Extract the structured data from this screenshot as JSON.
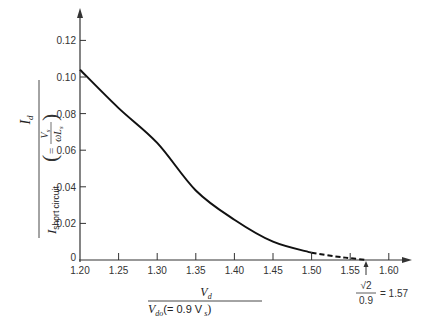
{
  "chart_data": {
    "type": "line",
    "title": "",
    "xlabel": "V_d / V_do (= 0.9 V_s)",
    "ylabel": "I_d / I_short circuit (= V_s / (ωL_s))",
    "xlim": [
      1.2,
      1.62
    ],
    "ylim": [
      0,
      0.13
    ],
    "grid": false,
    "x_ticks": [
      "1.20",
      "1.25",
      "1.30",
      "1.35",
      "1.40",
      "1.45",
      "1.50",
      "1.55",
      "1.60"
    ],
    "y_ticks": [
      "0",
      "0.02",
      "0.04",
      "0.06",
      "0.08",
      "0.10",
      "0.12"
    ],
    "series": [
      {
        "name": "solid",
        "style": "solid",
        "x": [
          1.2,
          1.25,
          1.3,
          1.35,
          1.4,
          1.45,
          1.5
        ],
        "values": [
          0.104,
          0.083,
          0.064,
          0.038,
          0.022,
          0.01,
          0.004
        ]
      },
      {
        "name": "dashed",
        "style": "dashed",
        "x": [
          1.5,
          1.53,
          1.55,
          1.57
        ],
        "values": [
          0.004,
          0.002,
          0.001,
          0.0
        ]
      }
    ],
    "annotations": [
      {
        "text": "√2 / 0.9 = 1.57",
        "x": 1.57,
        "arrow": "up"
      }
    ]
  },
  "labels": {
    "y_num": "I",
    "y_num_sub": "d",
    "y_den": "I",
    "y_den_sub": "short circuit",
    "y_paren_num": "V",
    "y_paren_num_sub": "s",
    "y_paren_den": "ωL",
    "y_paren_den_sub": "s",
    "x_num": "V",
    "x_num_sub": "d",
    "x_den": "V",
    "x_den_sub": "do",
    "x_den_rest": "(= 0.9 V",
    "x_den_rest_sub": "s",
    "x_den_close": ")",
    "annot_num": "√2",
    "annot_den": "0.9",
    "annot_eq": "= 1.57"
  }
}
